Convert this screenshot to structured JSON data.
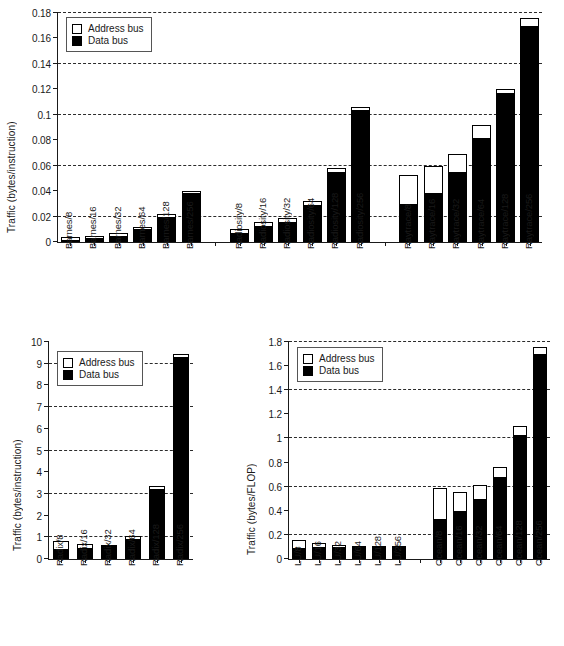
{
  "legend": {
    "address_label": "Address bus",
    "data_label": "Data bus",
    "address_color": "#ffffff",
    "data_color": "#000000"
  },
  "chart_data": [
    {
      "id": "top",
      "type": "bar",
      "stacked": true,
      "title": "",
      "xlabel": "",
      "ylabel": "Traffic (bytes/instruction)",
      "ylim": [
        0,
        0.18
      ],
      "yticks": [
        0,
        0.02,
        0.04,
        0.06,
        0.08,
        0.1,
        0.12,
        0.14,
        0.16,
        0.18
      ],
      "ytick_labels": [
        "0",
        "0.02",
        "0.04",
        "0.06",
        "0.08",
        "0.1",
        "0.12",
        "0.14",
        "0.16",
        "0.18"
      ],
      "gridlines": [
        0.02,
        0.06,
        0.1,
        0.14,
        0.18
      ],
      "grid": true,
      "legend_position": "top-left",
      "categories": [
        "Barnes/8",
        "Barnes/16",
        "Barnes/32",
        "Barnes/64",
        "Barnes/128",
        "Barnes/256",
        "Radiosity/8",
        "Radiosity/16",
        "Radiosity/32",
        "Radiosity/64",
        "Radiosity/128",
        "Radiosity/256",
        "Raytrace/8",
        "Raytrace/16",
        "Raytrace/32",
        "Raytrace/64",
        "Raytrace/128",
        "Raytrace/256"
      ],
      "group_gaps_after": [
        5,
        11
      ],
      "series": [
        {
          "name": "Data bus",
          "values": [
            0.002,
            0.003,
            0.005,
            0.01,
            0.02,
            0.039,
            0.007,
            0.013,
            0.016,
            0.029,
            0.055,
            0.104,
            0.03,
            0.039,
            0.055,
            0.082,
            0.117,
            0.17
          ]
        },
        {
          "name": "Address bus",
          "values": [
            0.002,
            0.002,
            0.002,
            0.002,
            0.002,
            0.001,
            0.003,
            0.003,
            0.003,
            0.003,
            0.003,
            0.002,
            0.023,
            0.021,
            0.014,
            0.01,
            0.003,
            0.006
          ]
        }
      ],
      "totals": [
        0.004,
        0.005,
        0.007,
        0.012,
        0.022,
        0.04,
        0.01,
        0.016,
        0.019,
        0.032,
        0.058,
        0.106,
        0.053,
        0.06,
        0.069,
        0.092,
        0.12,
        0.176
      ]
    },
    {
      "id": "bottom-left",
      "type": "bar",
      "stacked": true,
      "title": "",
      "xlabel": "",
      "ylabel": "Traffic (bytes/instruction)",
      "ylim": [
        0,
        10
      ],
      "yticks": [
        0,
        1,
        2,
        3,
        4,
        5,
        6,
        7,
        8,
        9,
        10
      ],
      "ytick_labels": [
        "0",
        "1",
        "2",
        "3",
        "4",
        "5",
        "6",
        "7",
        "8",
        "9",
        "10"
      ],
      "gridlines": [
        1,
        3,
        5,
        7,
        9
      ],
      "grid": true,
      "legend_position": "top-left",
      "categories": [
        "Radix/8",
        "Radix/16",
        "Radix/32",
        "Radix/64",
        "Radix/128",
        "Radix/256"
      ],
      "group_gaps_after": [],
      "series": [
        {
          "name": "Data bus",
          "values": [
            0.45,
            0.52,
            0.62,
            0.94,
            3.22,
            9.3
          ]
        },
        {
          "name": "Address bus",
          "values": [
            0.37,
            0.16,
            0.04,
            0.1,
            0.15,
            0.15
          ]
        }
      ],
      "totals": [
        0.82,
        0.68,
        0.66,
        1.04,
        3.37,
        9.45
      ]
    },
    {
      "id": "bottom-right",
      "type": "bar",
      "stacked": true,
      "title": "",
      "xlabel": "",
      "ylabel": "Traffic (bytes/FLOP)",
      "ylim": [
        0,
        1.8
      ],
      "yticks": [
        0,
        0.2,
        0.4,
        0.6,
        0.8,
        1.0,
        1.2,
        1.4,
        1.6,
        1.8
      ],
      "ytick_labels": [
        "0",
        "0.2",
        "0.4",
        "0.6",
        "0.8",
        "1",
        "1.2",
        "1.4",
        "1.6",
        "1.8"
      ],
      "gridlines": [
        0.2,
        0.6,
        1.0,
        1.4,
        1.8
      ],
      "grid": true,
      "legend_position": "top-left",
      "categories": [
        "LU/8",
        "LU/16",
        "LU/32",
        "LU/64",
        "LU/128",
        "LU/256",
        "Ocean/8",
        "Ocean/16",
        "Ocean/32",
        "Ocean/64",
        "Ocean/128",
        "Ocean/256"
      ],
      "group_gaps_after": [
        5
      ],
      "series": [
        {
          "name": "Data bus",
          "values": [
            0.09,
            0.1,
            0.1,
            0.1,
            0.1,
            0.1,
            0.33,
            0.4,
            0.5,
            0.68,
            1.03,
            1.7
          ]
        },
        {
          "name": "Address bus",
          "values": [
            0.07,
            0.03,
            0.02,
            0.01,
            0.01,
            0.01,
            0.26,
            0.16,
            0.11,
            0.08,
            0.07,
            0.06
          ]
        }
      ],
      "totals": [
        0.16,
        0.13,
        0.12,
        0.11,
        0.11,
        0.11,
        0.59,
        0.56,
        0.61,
        0.76,
        1.1,
        1.76
      ]
    }
  ]
}
